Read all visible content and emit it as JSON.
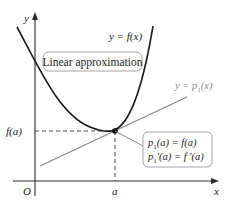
{
  "diagram": {
    "title": "Linear approximation",
    "axes": {
      "x_label": "x",
      "y_label": "y",
      "origin_label": "O"
    },
    "curve": {
      "label": "y = f(x)",
      "label_parts": {
        "lhs": "y = ",
        "rhs": "f(x)"
      },
      "color": "#1a1a1a"
    },
    "tangent_line": {
      "label_lhs": "y = p",
      "label_sub": "1",
      "label_rhs": "(x)",
      "color": "#8a8a8a"
    },
    "point": {
      "x_tick_label": "a",
      "y_tick_label": "f(a)"
    },
    "callout": {
      "line1": {
        "p": "p",
        "sub": "1",
        "rest": "(a) = f(a)"
      },
      "line2": {
        "p": "p",
        "sub": "1",
        "rest": "′(a) = f ′(a)"
      }
    },
    "colors": {
      "axis": "#2a2a2a",
      "curve": "#1a1a1a",
      "tangent": "#8a8a8a",
      "dashed": "#333333",
      "box_border": "#9a9a9a"
    }
  }
}
